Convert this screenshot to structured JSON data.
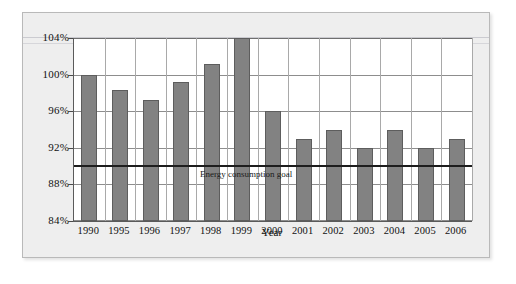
{
  "chart_data": {
    "type": "bar",
    "title": "",
    "subtitle": "",
    "xlabel": "Year",
    "ylabel": "",
    "categories": [
      "1990",
      "1995",
      "1996",
      "1997",
      "1998",
      "1999",
      "2000",
      "2001",
      "2002",
      "2003",
      "2004",
      "2005",
      "2006"
    ],
    "values": [
      100,
      98.3,
      97.2,
      99.2,
      101.2,
      104,
      96,
      93,
      94,
      92,
      94,
      92,
      93
    ],
    "series": [
      {
        "name": "Energy consumption index",
        "values": [
          100,
          98.3,
          97.2,
          99.2,
          101.2,
          104,
          96,
          93,
          94,
          92,
          94,
          92,
          93
        ]
      }
    ],
    "ylim": [
      84,
      104
    ],
    "yticks": [
      84,
      88,
      92,
      96,
      100,
      104
    ],
    "ytick_labels": [
      "84%",
      "88%",
      "92%",
      "96%",
      "100%",
      "104%"
    ],
    "grid": true,
    "legend": false,
    "legend_position": "none",
    "annotations": [
      {
        "name": "goal-line",
        "label": "Energy consumption goal",
        "value": 90,
        "type": "horizontal-reference-line"
      }
    ],
    "bar_color": "#828282",
    "bar_border_color": "#5d5d5d",
    "goal_line_color": "#1d1d1d",
    "plot_background": "#ffffff",
    "panel_background": "#eeeeee"
  }
}
